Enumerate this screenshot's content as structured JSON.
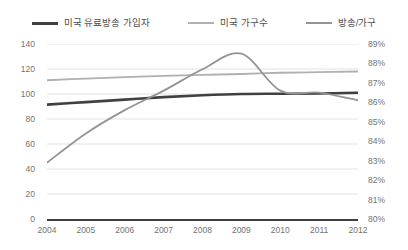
{
  "legend": {
    "position": "top",
    "items": [
      {
        "label": "미국 유료방송 가입자",
        "color": "#404040",
        "icon": "line-swatch-icon"
      },
      {
        "label": "미국 가구수",
        "color": "#b0b0b0",
        "icon": "line-swatch-icon"
      },
      {
        "label": "방송/가구",
        "color": "#949494",
        "icon": "line-swatch-icon"
      }
    ]
  },
  "axes": {
    "x_ticks": [
      "2004",
      "2005",
      "2006",
      "2007",
      "2008",
      "2009",
      "2010",
      "2011",
      "2012"
    ],
    "y_left_ticks": [
      "140",
      "120",
      "100",
      "80",
      "60",
      "40",
      "20",
      "0"
    ],
    "y_right_ticks": [
      "89%",
      "88%",
      "87%",
      "86%",
      "85%",
      "84%",
      "83%",
      "82%",
      "81%",
      "80%"
    ]
  },
  "chart_data": {
    "type": "line",
    "title": "",
    "subtitle": "",
    "xlabel": "",
    "ylabel": "",
    "y2label": "",
    "grid": true,
    "legend_position": "top",
    "x": [
      2004,
      2005,
      2006,
      2007,
      2008,
      2009,
      2010,
      2011,
      2012
    ],
    "categories": [
      "2004",
      "2005",
      "2006",
      "2007",
      "2008",
      "2009",
      "2010",
      "2011",
      "2012"
    ],
    "ylim": [
      0,
      140
    ],
    "y2lim": [
      80,
      89
    ],
    "series": [
      {
        "name": "미국 유료방송 가입자",
        "axis": "left",
        "color": "#404040",
        "values": [
          91.5,
          93.5,
          95.5,
          97.5,
          99.0,
          100.0,
          100.2,
          100.4,
          101.0
        ]
      },
      {
        "name": "미국 가구수",
        "axis": "left",
        "color": "#b0b0b0",
        "values": [
          111.0,
          112.3,
          113.5,
          114.5,
          115.3,
          116.0,
          117.0,
          117.5,
          118.0
        ]
      },
      {
        "name": "방송/가구",
        "axis": "right",
        "color": "#949494",
        "values": [
          82.9,
          84.4,
          85.6,
          86.6,
          87.7,
          88.5,
          86.6,
          86.5,
          86.1
        ]
      }
    ]
  }
}
